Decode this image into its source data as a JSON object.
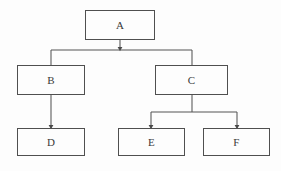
{
  "diagram": {
    "type": "tree-hierarchy-flowchart",
    "title": "",
    "background_color": "#fdfdfd",
    "border_color": "#4f4f4f",
    "line_color": "#555555",
    "text_color": "#3a3a3a",
    "nodes": [
      {
        "id": "A",
        "label": "A",
        "x": 85,
        "y": 10,
        "w": 70,
        "h": 30,
        "level": 0
      },
      {
        "id": "B",
        "label": "B",
        "x": 17,
        "y": 65,
        "w": 68,
        "h": 30,
        "level": 1
      },
      {
        "id": "C",
        "label": "C",
        "x": 155,
        "y": 65,
        "w": 73,
        "h": 30,
        "level": 1
      },
      {
        "id": "D",
        "label": "D",
        "x": 17,
        "y": 128,
        "w": 68,
        "h": 28,
        "level": 2
      },
      {
        "id": "E",
        "label": "E",
        "x": 118,
        "y": 128,
        "w": 67,
        "h": 28,
        "level": 2
      },
      {
        "id": "F",
        "label": "F",
        "x": 203,
        "y": 128,
        "w": 67,
        "h": 28,
        "level": 2
      }
    ],
    "edges": [
      {
        "from": "A",
        "to": "B",
        "style": "orthogonal-bus",
        "arrowhead": false
      },
      {
        "from": "A",
        "to": "C",
        "style": "orthogonal-bus",
        "arrowhead": true
      },
      {
        "from": "B",
        "to": "D",
        "style": "straight-vertical",
        "arrowhead": true
      },
      {
        "from": "C",
        "to": "E",
        "style": "orthogonal-bus",
        "arrowhead": true
      },
      {
        "from": "C",
        "to": "F",
        "style": "orthogonal-bus",
        "arrowhead": true
      }
    ],
    "bus_lines": [
      {
        "id": "top-bus",
        "y": 50,
        "x_start": 51,
        "x_end": 192
      },
      {
        "id": "bottom-bus",
        "y": 112,
        "x_start": 151,
        "x_end": 237
      }
    ]
  }
}
